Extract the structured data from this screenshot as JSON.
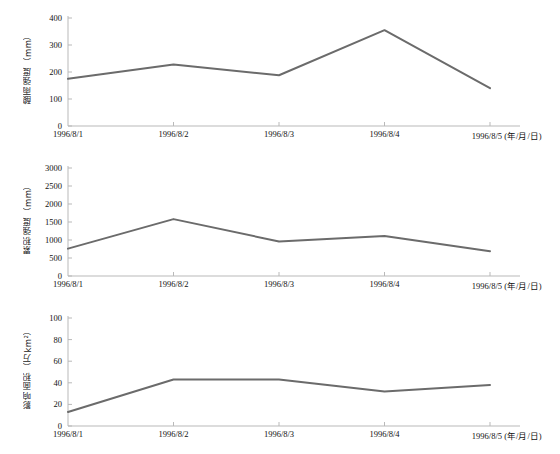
{
  "figure": {
    "caption": "",
    "line_color": "#6b6b6b",
    "axis_color": "#b9b9b9",
    "background": "#ffffff"
  },
  "charts": [
    {
      "id": "chart-intensity",
      "type": "line",
      "title": "",
      "ylabel": "酸雨强度（mm）",
      "xlabel": "",
      "categories": [
        "1996/8/1",
        "1996/8/2",
        "1996/8/3",
        "1996/8/4",
        "1996/8/5 (年/月/日)"
      ],
      "yticks": [
        0,
        100,
        200,
        300,
        400
      ],
      "ylim": [
        0,
        400
      ],
      "values": [
        175,
        228,
        188,
        355,
        140
      ],
      "grid": false,
      "legend": "none"
    },
    {
      "id": "chart-accumulation",
      "type": "line",
      "title": "",
      "ylabel": "累积强度（mm）",
      "xlabel": "",
      "categories": [
        "1996/8/1",
        "1996/8/2",
        "1996/8/3",
        "1996/8/4",
        "1996/8/5 (年/月/日)"
      ],
      "yticks": [
        0,
        500,
        1000,
        1500,
        2000,
        2500,
        3000
      ],
      "ylim": [
        0,
        3000
      ],
      "values": [
        760,
        1580,
        960,
        1110,
        690
      ],
      "grid": false,
      "legend": "none"
    },
    {
      "id": "chart-affected-area",
      "type": "line",
      "title": "",
      "ylabel": "影响面积（万km²）",
      "xlabel": "",
      "categories": [
        "1996/8/1",
        "1996/8/2",
        "1996/8/3",
        "1996/8/4",
        "1996/8/5 (年/月/日)"
      ],
      "yticks": [
        0,
        20,
        40,
        60,
        80,
        100
      ],
      "ylim": [
        0,
        100
      ],
      "values": [
        13,
        43,
        43,
        32,
        38
      ],
      "grid": false,
      "legend": "none"
    }
  ],
  "chart_data": {
    "type": "line",
    "title": "",
    "xlabel": "年/月/日",
    "x": [
      "1996/8/1",
      "1996/8/2",
      "1996/8/3",
      "1996/8/4",
      "1996/8/5"
    ],
    "panels": [
      {
        "name": "酸雨强度（mm）",
        "ylabel": "酸雨强度（mm）",
        "ylim": [
          0,
          400
        ],
        "yticks": [
          0,
          100,
          200,
          300,
          400
        ],
        "values": [
          175,
          228,
          188,
          355,
          140
        ]
      },
      {
        "name": "累积强度（mm）",
        "ylabel": "累积强度（mm）",
        "ylim": [
          0,
          3000
        ],
        "yticks": [
          0,
          500,
          1000,
          1500,
          2000,
          2500,
          3000
        ],
        "values": [
          760,
          1580,
          960,
          1110,
          690
        ]
      },
      {
        "name": "影响面积（万km²）",
        "ylabel": "影响面积（万km²）",
        "ylim": [
          0,
          100
        ],
        "yticks": [
          0,
          20,
          40,
          60,
          80,
          100
        ],
        "values": [
          13,
          43,
          43,
          32,
          38
        ]
      }
    ],
    "grid": false,
    "legend": "none"
  }
}
